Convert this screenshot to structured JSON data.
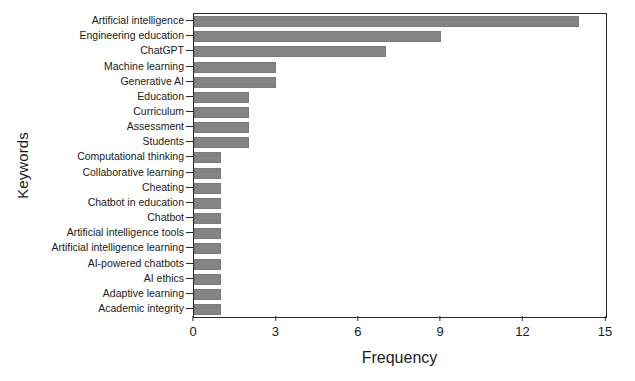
{
  "chart_data": {
    "type": "bar",
    "orientation": "horizontal",
    "title": "",
    "xlabel": "Frequency",
    "ylabel": "Keywords",
    "xlim": [
      0,
      15
    ],
    "xticks": [
      0,
      3,
      6,
      9,
      12,
      15
    ],
    "xtick_labels": [
      "0",
      "3",
      "6",
      "9",
      "12",
      "15"
    ],
    "grid": false,
    "legend": null,
    "bar_color": "#848484",
    "axis_color": "#2b2b2b",
    "categories": [
      "Artificial intelligence",
      "Engineering education",
      "ChatGPT",
      "Machine learning",
      "Generative AI",
      "Education",
      "Curriculum",
      "Assessment",
      "Students",
      "Computational thinking",
      "Collaborative learning",
      "Cheating",
      "Chatbot in education",
      "Chatbot",
      "Artificial intelligence tools",
      "Artificial intelligence learning",
      "AI-powered chatbots",
      "AI ethics",
      "Adaptive learning",
      "Academic integrity"
    ],
    "values": [
      14,
      9,
      7,
      3,
      3,
      2,
      2,
      2,
      2,
      1,
      1,
      1,
      1,
      1,
      1,
      1,
      1,
      1,
      1,
      1
    ]
  }
}
